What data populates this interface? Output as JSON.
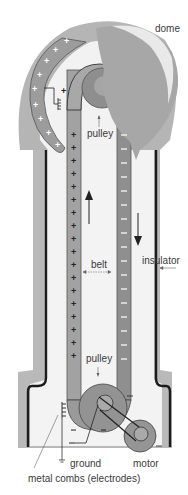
{
  "diagram": {
    "labels": {
      "dome": "dome",
      "pulley_top": "pulley",
      "belt": "belt",
      "insulator": "insulator",
      "pulley_bottom": "pulley",
      "ground": "ground",
      "motor": "motor",
      "combs": "metal combs (electrodes)"
    },
    "signs": {
      "plus": "+",
      "minus": "–"
    },
    "colors": {
      "dome": "#a9a9a9",
      "dome_highlight": "#e6e6e6",
      "shell": "#b4b4b4",
      "belt": "#999999",
      "pulley": "#8d8d8d",
      "insulator_line": "#1a1a1a",
      "interior": "#f4f4f4",
      "text": "#3a3a3a"
    }
  }
}
